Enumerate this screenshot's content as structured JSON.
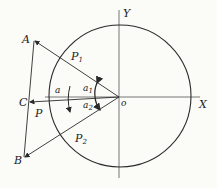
{
  "diagram": {
    "labels": {
      "A": "A",
      "B": "B",
      "C": "C",
      "P": "P",
      "P1": "P",
      "P1_sub": "1",
      "P2": "P",
      "P2_sub": "2",
      "X": "X",
      "Y": "Y",
      "O": "o",
      "alpha": "a",
      "alpha1": "a",
      "alpha1_sub": "1",
      "alpha2": "a",
      "alpha2_sub": "2"
    },
    "colors": {
      "line": "#2a2a2a",
      "background": "#fbfbf8"
    }
  }
}
